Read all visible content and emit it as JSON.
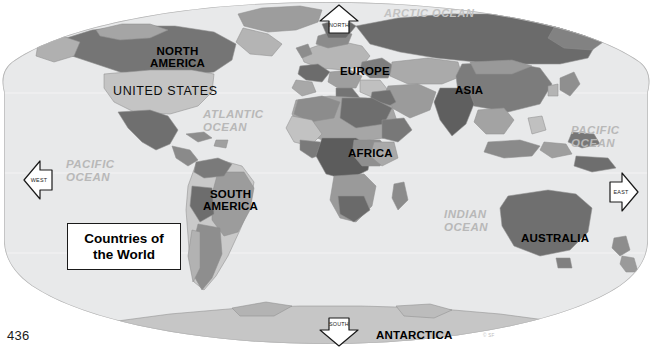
{
  "page": {
    "page_number": "436",
    "credit": "© SF",
    "background_color": "#ffffff"
  },
  "map": {
    "title_box": {
      "line1": "Countries of",
      "line2": "the World",
      "text": "Countries of\nthe World"
    },
    "projection_shape": "oval-robinson",
    "colors": {
      "ocean_fill": "#e8e9ea",
      "ocean_label": "#b8b8b8",
      "outline": "#9a9a9a",
      "land_light": "#d0d0d0",
      "land_mid": "#a8a8a8",
      "land_dark": "#7d7d7d",
      "land_darker": "#636363",
      "label_text": "#000000",
      "graticule": "#f4f4f4"
    },
    "continent_labels": [
      {
        "id": "north-america",
        "text": "NORTH\nAMERICA",
        "x": 150,
        "y": 46
      },
      {
        "id": "europe",
        "text": "EUROPE",
        "x": 340,
        "y": 66
      },
      {
        "id": "asia",
        "text": "ASIA",
        "x": 455,
        "y": 85
      },
      {
        "id": "africa",
        "text": "AFRICA",
        "x": 348,
        "y": 148
      },
      {
        "id": "south-america",
        "text": "SOUTH\nAMERICA",
        "x": 203,
        "y": 189
      },
      {
        "id": "australia",
        "text": "AUSTRALIA",
        "x": 521,
        "y": 233
      },
      {
        "id": "antarctica",
        "text": "ANTARCTICA",
        "x": 376,
        "y": 330
      }
    ],
    "country_labels": [
      {
        "id": "united-states",
        "text": "UNITED STATES",
        "x": 113,
        "y": 85
      }
    ],
    "ocean_labels": [
      {
        "id": "arctic-ocean",
        "text": "ARCTIC OCEAN",
        "x": 384,
        "y": 7
      },
      {
        "id": "atlantic-ocean",
        "text": "ATLANTIC\nOCEAN",
        "x": 203,
        "y": 108
      },
      {
        "id": "pacific-ocean-west",
        "text": "PACIFIC\nOCEAN",
        "x": 66,
        "y": 158
      },
      {
        "id": "pacific-ocean-east",
        "text": "PACIFIC\nOCEAN",
        "x": 571,
        "y": 124
      },
      {
        "id": "indian-ocean",
        "text": "INDIAN\nOCEAN",
        "x": 444,
        "y": 208
      }
    ],
    "compass_arrows": [
      {
        "id": "north",
        "label": "NORTH",
        "direction": "up",
        "x": 318,
        "y": 3
      },
      {
        "id": "south",
        "label": "SOUTH",
        "direction": "down",
        "x": 318,
        "y": 316
      },
      {
        "id": "west",
        "label": "WEST",
        "direction": "left",
        "x": 22,
        "y": 159
      },
      {
        "id": "east",
        "label": "EAST",
        "direction": "right",
        "x": 608,
        "y": 171
      }
    ]
  }
}
